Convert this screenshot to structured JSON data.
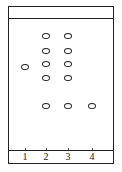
{
  "diagram": {
    "type": "thin-layer chromatography plate",
    "lanes": [
      {
        "label": "1",
        "x": 25,
        "spots_y": [
          67
        ]
      },
      {
        "label": "2",
        "x": 46,
        "spots_y": [
          36,
          51,
          64,
          78,
          106
        ]
      },
      {
        "label": "3",
        "x": 68,
        "spots_y": [
          36,
          51,
          64,
          78,
          106
        ]
      },
      {
        "label": "4",
        "x": 92,
        "spots_y": [
          106
        ]
      }
    ]
  }
}
